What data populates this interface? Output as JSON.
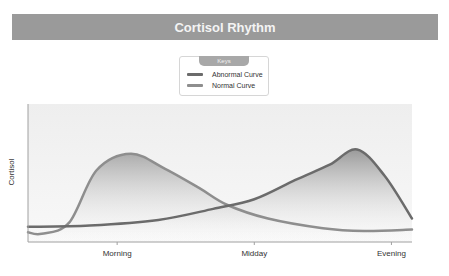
{
  "header": {
    "title": "Cortisol Rhythm"
  },
  "legend": {
    "title": "Keys",
    "items": [
      {
        "label": "Abnormal Curve",
        "color": "#6b6b6b"
      },
      {
        "label": "Normal Curve",
        "color": "#8e8e8e"
      }
    ]
  },
  "chart_data": {
    "type": "line",
    "title": "Cortisol Rhythm",
    "xlabel": "",
    "ylabel": "Cortisol",
    "x_tick_labels": [
      "Morning",
      "Midday",
      "Evening"
    ],
    "x_ticks": [
      0.5,
      1.5,
      2.5
    ],
    "xlim": [
      -0.15,
      2.65
    ],
    "ylim": [
      0,
      100
    ],
    "grid": false,
    "legend_position": "top-center",
    "series": [
      {
        "name": "Abnormal Curve",
        "color": "#6b6b6b",
        "filled": true,
        "points": [
          [
            -0.15,
            11
          ],
          [
            0.3,
            12
          ],
          [
            0.8,
            16
          ],
          [
            1.2,
            24
          ],
          [
            1.5,
            31
          ],
          [
            1.8,
            45
          ],
          [
            2.05,
            56
          ],
          [
            2.25,
            67
          ],
          [
            2.45,
            48
          ],
          [
            2.65,
            17
          ]
        ]
      },
      {
        "name": "Normal Curve",
        "color": "#8e8e8e",
        "filled": true,
        "points": [
          [
            -0.15,
            7
          ],
          [
            -0.05,
            6
          ],
          [
            0.15,
            14
          ],
          [
            0.35,
            52
          ],
          [
            0.6,
            64
          ],
          [
            0.85,
            53
          ],
          [
            1.1,
            39
          ],
          [
            1.3,
            27
          ],
          [
            1.6,
            17
          ],
          [
            2.0,
            10
          ],
          [
            2.3,
            8
          ],
          [
            2.65,
            9
          ]
        ]
      }
    ]
  }
}
